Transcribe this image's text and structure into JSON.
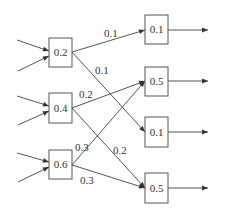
{
  "diagram": {
    "type": "network-flow",
    "left_nodes": [
      {
        "id": "L1",
        "label": "0.2"
      },
      {
        "id": "L2",
        "label": "0.4"
      },
      {
        "id": "L3",
        "label": "0.6"
      }
    ],
    "right_nodes": [
      {
        "id": "R1",
        "label": "0.1"
      },
      {
        "id": "R2",
        "label": "0.5"
      },
      {
        "id": "R3",
        "label": "0.1"
      },
      {
        "id": "R4",
        "label": "0.5"
      }
    ],
    "edges": [
      {
        "from": "L1",
        "to": "R1",
        "label": "0.1"
      },
      {
        "from": "L1",
        "to": "R3",
        "label": "0.1"
      },
      {
        "from": "L2",
        "to": "R2",
        "label": "0.2"
      },
      {
        "from": "L2",
        "to": "R4",
        "label": "0.2"
      },
      {
        "from": "L3",
        "to": "R2",
        "label": "0.3"
      },
      {
        "from": "L3",
        "to": "R4",
        "label": "0.3"
      }
    ],
    "inputs_per_left_node": 2,
    "outputs_per_right_node": 1,
    "colors": {
      "stroke": "#555555",
      "text": "#333333",
      "background": "#ffffff"
    }
  }
}
